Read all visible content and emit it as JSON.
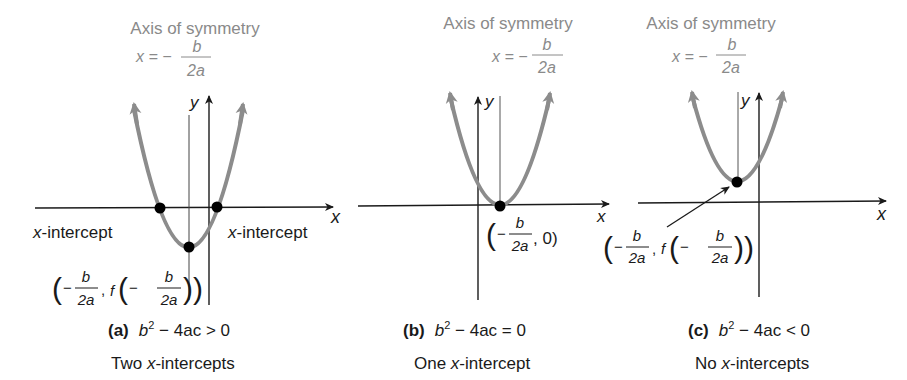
{
  "figure": {
    "panels": [
      {
        "id": "a",
        "axis_of_symmetry_label": "Axis of symmetry",
        "axis_formula": {
          "lhs": "x = −",
          "num": "b",
          "den": "2a"
        },
        "axis_x_label": "x",
        "axis_y_label": "y",
        "intercept_label_left": "x-intercept",
        "intercept_label_right": "x-intercept",
        "vertex_label": {
          "open": "(",
          "minus1": "−",
          "num1": "b",
          "den1": "2a",
          "sep": ",",
          "f": "f",
          "open2": "(",
          "minus2": "−",
          "num2": "b",
          "den2": "2a",
          "close": "))"
        },
        "caption_tag": "(a)",
        "caption_expr": {
          "b": "b",
          "exp": "2",
          "rest": " − 4ac > 0"
        },
        "description": "Two x-intercepts",
        "description_parts": [
          "Two ",
          "x",
          "-intercepts"
        ]
      },
      {
        "id": "b",
        "axis_of_symmetry_label": "Axis of symmetry",
        "axis_formula": {
          "lhs": "x = −",
          "num": "b",
          "den": "2a"
        },
        "axis_x_label": "x",
        "axis_y_label": "y",
        "vertex_label": {
          "open": "(",
          "minus1": "−",
          "num1": "b",
          "den1": "2a",
          "tail": ", 0)"
        },
        "caption_tag": "(b)",
        "caption_expr": {
          "b": "b",
          "exp": "2",
          "rest": " − 4ac = 0"
        },
        "description": "One x-intercept",
        "description_parts": [
          "One ",
          "x",
          "-intercept"
        ]
      },
      {
        "id": "c",
        "axis_of_symmetry_label": "Axis of symmetry",
        "axis_formula": {
          "lhs": "x = −",
          "num": "b",
          "den": "2a"
        },
        "axis_x_label": "x",
        "axis_y_label": "y",
        "vertex_label": {
          "open": "(",
          "minus1": "−",
          "num1": "b",
          "den1": "2a",
          "sep": ",",
          "f": "f",
          "open2": "(",
          "minus2": "−",
          "num2": "b",
          "den2": "2a",
          "close": "))"
        },
        "caption_tag": "(c)",
        "caption_expr": {
          "b": "b",
          "exp": "2",
          "rest": " − 4ac < 0"
        },
        "description": "No x-intercepts",
        "description_parts": [
          "No ",
          "x",
          "-intercepts"
        ]
      }
    ],
    "colors": {
      "curve": "#8c8c8c",
      "axes": "#1a1a1a",
      "label_gray": "#8a8a8a",
      "point": "#000000"
    }
  }
}
